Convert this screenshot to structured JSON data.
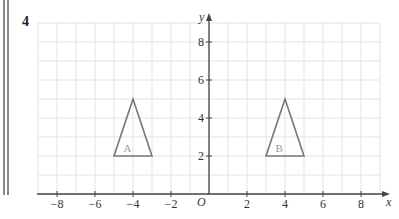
{
  "question_number": "4",
  "chart_data": {
    "type": "diagram",
    "title": "",
    "xlabel": "x",
    "ylabel": "y",
    "origin_label": "O",
    "xlim": [
      -9,
      9
    ],
    "ylim": [
      0,
      9
    ],
    "grid": true,
    "x_ticks": [
      -8,
      -6,
      -4,
      -2,
      2,
      4,
      6,
      8
    ],
    "x_tick_labels": [
      "−8",
      "−6",
      "−4",
      "−2",
      "2",
      "4",
      "6",
      "8"
    ],
    "y_ticks": [
      2,
      4,
      6,
      8
    ],
    "y_tick_labels": [
      "2",
      "4",
      "6",
      "8"
    ],
    "shapes": [
      {
        "name": "A",
        "vertices": [
          [
            -5,
            2
          ],
          [
            -3,
            2
          ],
          [
            -4,
            5
          ]
        ],
        "label_pos": [
          -4.5,
          2.4
        ]
      },
      {
        "name": "B",
        "vertices": [
          [
            3,
            2
          ],
          [
            5,
            2
          ],
          [
            4,
            5
          ]
        ],
        "label_pos": [
          3.5,
          2.4
        ]
      }
    ],
    "colors": {
      "grid": "#e3e3e3",
      "axis": "#444444",
      "shape": "#777777",
      "label": "#999999"
    }
  }
}
